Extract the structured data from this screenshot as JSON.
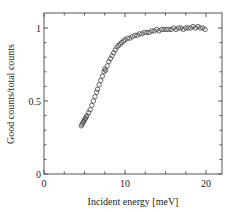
{
  "chart_data": {
    "type": "scatter",
    "title": "",
    "xlabel": "Incident energy [meV]",
    "ylabel": "Good counts/total counts",
    "xlim": [
      0,
      22
    ],
    "ylim": [
      0,
      1.1
    ],
    "x_ticks": [
      0,
      10,
      20
    ],
    "x_tick_labels": [
      "0",
      "10",
      "20"
    ],
    "y_ticks": [
      0,
      0.5,
      1
    ],
    "y_tick_labels": [
      "0",
      "0.5",
      "1"
    ],
    "grid": false,
    "legend": null,
    "marker": "open-circle",
    "series": [
      {
        "name": "Good counts/total counts",
        "x": [
          4.6,
          4.7,
          4.8,
          4.9,
          5.0,
          5.1,
          5.2,
          5.3,
          5.5,
          5.7,
          5.9,
          6.1,
          6.3,
          6.5,
          6.6,
          6.8,
          7.0,
          7.2,
          7.4,
          7.5,
          7.6,
          7.8,
          8.0,
          8.2,
          8.4,
          8.6,
          8.8,
          9.0,
          9.2,
          9.4,
          9.6,
          9.8,
          10.0,
          10.3,
          10.6,
          10.9,
          11.2,
          11.5,
          11.8,
          12.1,
          12.4,
          12.7,
          13.0,
          13.3,
          13.6,
          13.9,
          14.2,
          14.5,
          14.8,
          15.1,
          15.4,
          15.7,
          16.0,
          16.3,
          16.6,
          16.9,
          17.2,
          17.5,
          17.8,
          18.1,
          18.4,
          18.7,
          19.0,
          19.3,
          19.6,
          19.9
        ],
        "y": [
          0.33,
          0.34,
          0.35,
          0.36,
          0.37,
          0.38,
          0.39,
          0.4,
          0.42,
          0.44,
          0.47,
          0.5,
          0.53,
          0.56,
          0.58,
          0.61,
          0.64,
          0.67,
          0.7,
          0.72,
          0.71,
          0.74,
          0.77,
          0.79,
          0.81,
          0.83,
          0.85,
          0.87,
          0.88,
          0.89,
          0.9,
          0.91,
          0.92,
          0.93,
          0.93,
          0.94,
          0.95,
          0.95,
          0.96,
          0.96,
          0.97,
          0.97,
          0.97,
          0.98,
          0.98,
          0.99,
          0.98,
          0.99,
          0.99,
          0.99,
          0.99,
          0.99,
          1.0,
          0.99,
          1.0,
          1.0,
          0.99,
          1.0,
          1.0,
          1.0,
          1.01,
          1.0,
          1.01,
          1.0,
          1.0,
          0.99
        ]
      }
    ]
  }
}
